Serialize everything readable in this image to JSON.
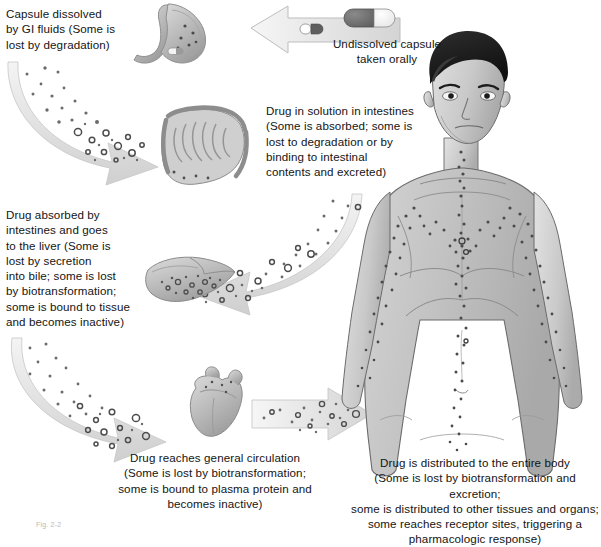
{
  "figure": {
    "caption": "Fig. 2-2"
  },
  "labels": {
    "capsule_dissolved": "Capsule dissolved\nby GI fluids (Some is\nlost by degradation)",
    "undissolved_capsule": "Undissolved capsule\ntaken orally",
    "drug_in_solution": "Drug in solution in intestines\n(Some is absorbed; some is\nlost to degradation or by\nbinding to intestinal\ncontents and excreted)",
    "drug_absorbed_liver": "Drug absorbed by\nintestines and goes\nto the liver (Some is\nlost by secretion\ninto bile; some is lost\nby biotransformation;\nsome is bound to tissue\nand becomes inactive)",
    "general_circulation": "Drug reaches general circulation\n(Some is lost by biotransformation;\nsome is bound to plasma protein and\nbecomes inactive)",
    "entire_body": "Drug is distributed to the entire body\n(Some is lost by biotransformation and excretion;\nsome is distributed to other tissues and organs;\nsome reaches receptor sites, triggering a\npharmacologic response)"
  },
  "organs": [
    {
      "id": "stomach",
      "name": "stomach-illustration"
    },
    {
      "id": "intestines",
      "name": "intestines-illustration"
    },
    {
      "id": "liver",
      "name": "liver-illustration"
    },
    {
      "id": "heart",
      "name": "heart-illustration"
    },
    {
      "id": "body",
      "name": "human-body-illustration"
    }
  ],
  "arrows": [
    {
      "id": "mouth-to-stomach",
      "direction": "left",
      "style": "straight",
      "has_capsule": true
    },
    {
      "id": "stomach-to-intestines",
      "direction": "down-right",
      "style": "curved",
      "has_particles": true
    },
    {
      "id": "intestines-to-liver",
      "direction": "down-left",
      "style": "curved",
      "has_particles": true
    },
    {
      "id": "liver-to-heart",
      "direction": "down-right",
      "style": "curved",
      "has_particles": true
    },
    {
      "id": "heart-to-body",
      "direction": "right",
      "style": "straight",
      "has_particles": true
    }
  ],
  "colors": {
    "capsule_dark": "#6e6e6e",
    "capsule_light": "#f2f2f2",
    "arrow_fill": "#e2e2e2",
    "arrow_stroke": "#b8b8b8",
    "organ_fill": "#c3c3c3",
    "organ_stroke": "#8a8a8a",
    "body_fill": "#c6c6c6",
    "body_stroke": "#6a6a6a",
    "hair": "#1c1c1c",
    "particle": "#555555",
    "text": "#141414"
  }
}
